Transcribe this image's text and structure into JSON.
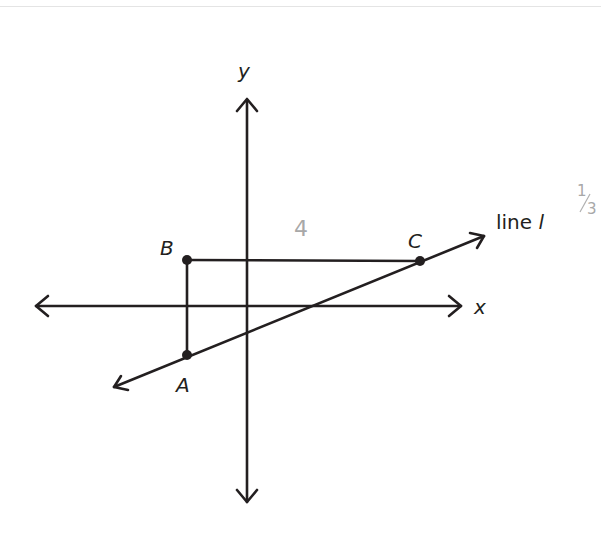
{
  "diagram": {
    "axes": {
      "x_label": "x",
      "y_label": "y"
    },
    "points": [
      {
        "name": "A",
        "label": "A"
      },
      {
        "name": "B",
        "label": "B"
      },
      {
        "name": "C",
        "label": "C"
      }
    ],
    "line": {
      "label_text": "line ",
      "label_var": "l"
    },
    "annotations": {
      "segment_length": "4",
      "score_numerator": "1",
      "score_denominator": "3"
    }
  }
}
